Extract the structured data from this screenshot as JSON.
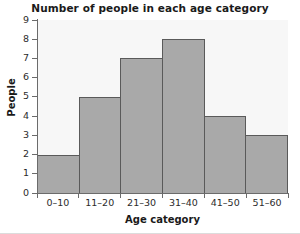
{
  "chart_data": {
    "type": "bar",
    "title": "Number of people in each age category",
    "xlabel": "Age category",
    "ylabel": "People",
    "categories": [
      "0–10",
      "11–20",
      "21–30",
      "31–40",
      "41–50",
      "51–60"
    ],
    "values": [
      2,
      5,
      7,
      8,
      4,
      3
    ],
    "ylim": [
      0,
      9
    ],
    "yticks": [
      0,
      1,
      2,
      3,
      4,
      5,
      6,
      7,
      8,
      9
    ],
    "ytick_labels": [
      "0",
      "1",
      "2",
      "3",
      "4",
      "5",
      "6",
      "7",
      "8",
      "9"
    ],
    "grid": false,
    "legend": false,
    "bar_style": "histogram-adjacent",
    "colors": {
      "bar_fill": "#a9a9a9",
      "bar_edge": "#5a5a5a",
      "axis": "#6b6b6b",
      "plot_background": "#f7f7f7",
      "figure_background": "#ffffff",
      "text": "#1a1a1a"
    }
  }
}
